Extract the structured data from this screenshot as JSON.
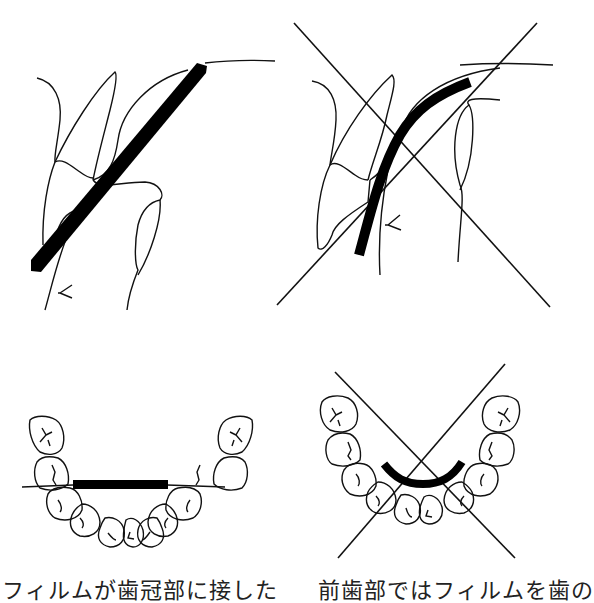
{
  "captions": {
    "left": "フィルムが歯冠部に接した",
    "right": "前歯部ではフィルムを歯の"
  },
  "panels": [
    {
      "id": "sagittal-correct",
      "crossed": false,
      "film": "straight"
    },
    {
      "id": "sagittal-incorrect",
      "crossed": true,
      "film": "curved"
    },
    {
      "id": "arch-correct",
      "crossed": false,
      "film": "straight"
    },
    {
      "id": "arch-incorrect",
      "crossed": true,
      "film": "curved"
    }
  ],
  "colors": {
    "line": "#111111",
    "film": "#000000",
    "background": "#ffffff"
  }
}
